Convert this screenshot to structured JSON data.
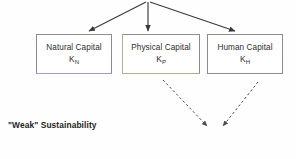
{
  "diagram": {
    "title": "\"Weak\" Sustainability",
    "background_color": "#fefefe",
    "boxes": [
      {
        "id": "natural-capital",
        "title": "Natural Capital",
        "symbol_base": "K",
        "symbol_subscript": "N",
        "border_color": "#8c8c8c",
        "fill_color": "#ffffff"
      },
      {
        "id": "physical-capital",
        "title": "Physical Capital",
        "symbol_base": "K",
        "symbol_subscript": "P",
        "border_color": "#8c8c8c",
        "fill_color": "#ffffff"
      },
      {
        "id": "human-capital",
        "title": "Human Capital",
        "symbol_base": "K",
        "symbol_subscript": "H",
        "border_color": "#8c8c8c",
        "fill_color": "#ffffff"
      }
    ],
    "solid_arrows": [
      {
        "id": "arrow-to-natural-capital",
        "style": "solid",
        "color": "#3a3a3a",
        "x1": 146,
        "y1": 2,
        "x2": 89,
        "y2": 31
      },
      {
        "id": "arrow-to-physical-capital",
        "style": "solid",
        "color": "#3a3a3a",
        "x1": 148,
        "y1": 2,
        "x2": 148,
        "y2": 31
      },
      {
        "id": "arrow-to-human-capital",
        "style": "solid",
        "color": "#3a3a3a",
        "x1": 150,
        "y1": 2,
        "x2": 235,
        "y2": 31
      }
    ],
    "dashed_arrows": [
      {
        "id": "dashed-arrow-from-physical-capital",
        "style": "dashed",
        "color": "#4a4a4a",
        "x1": 163,
        "y1": 80,
        "x2": 207,
        "y2": 126
      },
      {
        "id": "dashed-arrow-from-human-capital",
        "style": "dashed",
        "color": "#4a4a4a",
        "x1": 258,
        "y1": 82,
        "x2": 223,
        "y2": 126
      }
    ]
  }
}
